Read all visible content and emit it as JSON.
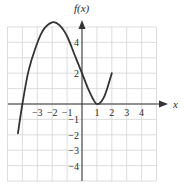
{
  "chart_data": {
    "type": "line",
    "title": "",
    "xlabel": "x",
    "ylabel": "f(x)",
    "xlim": [
      -5,
      5
    ],
    "ylim": [
      -5,
      5
    ],
    "grid": true,
    "legend": null,
    "x_ticks": [
      -3,
      -2,
      -1,
      1,
      2,
      3,
      4
    ],
    "x_tick_labels": [
      "−3",
      "−2",
      "−1",
      "1",
      "2",
      "3",
      "4"
    ],
    "y_ticks": [
      4,
      2,
      -1,
      -2,
      -3,
      -4
    ],
    "y_tick_labels": [
      "4",
      "2",
      "−1",
      "−2",
      "−3",
      "−4"
    ],
    "series": [
      {
        "name": "f(x)",
        "x": [
          -4.3,
          -4.0,
          -3.6,
          -3.1,
          -2.6,
          -2.0,
          -1.5,
          -1.0,
          -0.5,
          0.0,
          0.5,
          1.0,
          1.5,
          2.0
        ],
        "y": [
          -1.9,
          0.0,
          2.1,
          3.7,
          4.8,
          5.3,
          5.1,
          4.4,
          3.2,
          2.0,
          0.8,
          0.0,
          0.5,
          2.0
        ]
      }
    ],
    "key_points": {
      "local_max": [
        -2,
        5.3
      ],
      "local_min": [
        1,
        0
      ],
      "y_intercept": [
        0,
        2
      ],
      "x_intercepts": [
        -4,
        1
      ],
      "left_endpoint": [
        -4.3,
        -1.9
      ],
      "right_endpoint": [
        2,
        2
      ]
    }
  },
  "colors": {
    "curve": "#333333",
    "axis": "#333333",
    "grid": "#d4d4d4",
    "background": "#ffffff"
  }
}
